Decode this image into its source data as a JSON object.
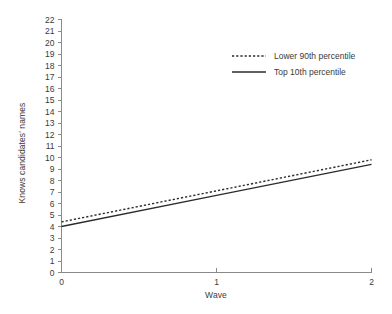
{
  "chart_data": {
    "type": "line",
    "title": "",
    "xlabel": "Wave",
    "ylabel": "Knows candidates' names",
    "x": [
      0,
      1,
      2
    ],
    "xlim": [
      0,
      2
    ],
    "ylim": [
      0,
      22
    ],
    "xticks": [
      "0",
      "1",
      "2"
    ],
    "yticks": [
      "0",
      "1",
      "2",
      "3",
      "4",
      "5",
      "6",
      "7",
      "8",
      "9",
      "10",
      "11",
      "12",
      "13",
      "14",
      "15",
      "16",
      "17",
      "18",
      "19",
      "20",
      "21",
      "22"
    ],
    "grid": false,
    "legend_position": "upper center",
    "series": [
      {
        "name": "Lower 90th percentile",
        "style": "dotted",
        "color": "#2b2b2b",
        "values": [
          4.4,
          7.1,
          9.8
        ]
      },
      {
        "name": "Top 10th percentile",
        "style": "solid",
        "color": "#2b2b2b",
        "values": [
          4.0,
          6.7,
          9.4
        ]
      }
    ]
  },
  "axis": {
    "line_color": "#8a8a8a",
    "text_color": "#3a3a3a"
  }
}
